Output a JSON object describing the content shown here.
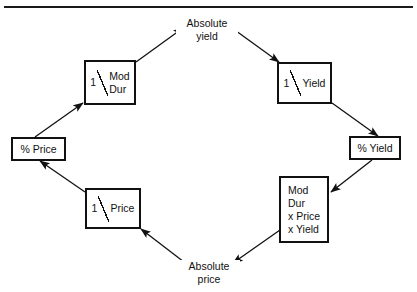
{
  "figure": {
    "type": "cycle-diagram",
    "title": "",
    "header_rule": true
  },
  "nodes": {
    "mod_dur_recip": {
      "kind": "box",
      "numerator": "1",
      "denominator_line1": "Mod",
      "denominator_line2": "Dur",
      "text": "1 / Mod Dur"
    },
    "yield_recip": {
      "kind": "box",
      "numerator": "1",
      "denominator_line1": "Yield",
      "text": "1 / Yield"
    },
    "pct_price": {
      "kind": "box",
      "text": "% Price"
    },
    "pct_yield": {
      "kind": "box",
      "text": "% Yield"
    },
    "mod_dur_product": {
      "kind": "box",
      "line1": "Mod",
      "line2": "Dur",
      "line3": "x Price",
      "line4": "x Yield",
      "text": "Mod Dur x Price x Yield"
    },
    "price_recip": {
      "kind": "box",
      "numerator": "1",
      "denominator_line1": "Price",
      "text": "1 / Price"
    },
    "absolute_yield": {
      "kind": "label",
      "line1": "Absolute",
      "line2": "yield",
      "text": "Absolute yield"
    },
    "absolute_price": {
      "kind": "label",
      "line1": "Absolute",
      "line2": "price",
      "text": "Absolute price"
    }
  },
  "edges": [
    {
      "from": "pct_price",
      "to": "mod_dur_recip",
      "direction": "up-right"
    },
    {
      "from": "mod_dur_recip",
      "to": "absolute_yield",
      "direction": "up-right"
    },
    {
      "from": "absolute_yield",
      "to": "yield_recip",
      "direction": "down-right"
    },
    {
      "from": "yield_recip",
      "to": "pct_yield",
      "direction": "down-right"
    },
    {
      "from": "pct_yield",
      "to": "mod_dur_product",
      "direction": "down-right"
    },
    {
      "from": "mod_dur_product",
      "to": "absolute_price",
      "direction": "down-left"
    },
    {
      "from": "absolute_price",
      "to": "price_recip",
      "direction": "up-left"
    },
    {
      "from": "price_recip",
      "to": "pct_price",
      "direction": "up-left"
    }
  ],
  "colors": {
    "line": "#111111",
    "background": "#ffffff",
    "text": "#111111"
  }
}
